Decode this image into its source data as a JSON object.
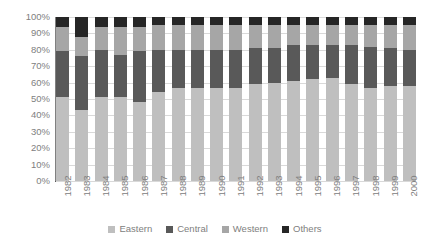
{
  "chart_data": {
    "type": "bar",
    "stacked": true,
    "stack_mode": "100-percent",
    "title": "",
    "xlabel": "",
    "ylabel": "",
    "ylim": [
      0,
      100
    ],
    "ytick_labels": [
      "100%",
      "90%",
      "80%",
      "70%",
      "60%",
      "50%",
      "40%",
      "30%",
      "20%",
      "10%",
      "0%"
    ],
    "ytick_values": [
      100,
      90,
      80,
      70,
      60,
      50,
      40,
      30,
      20,
      10,
      0
    ],
    "grid": true,
    "legend_position": "bottom",
    "categories": [
      "1982",
      "1983",
      "1984",
      "1985",
      "1986",
      "1987",
      "1988",
      "1989",
      "1990",
      "1991",
      "1992",
      "1993",
      "1994",
      "1995",
      "1996",
      "1997",
      "1998",
      "1999",
      "2000"
    ],
    "series": [
      {
        "name": "Eastern",
        "color": "#bfbfbf",
        "values": [
          51,
          43,
          51,
          51,
          48,
          54,
          57,
          57,
          57,
          57,
          59,
          60,
          61,
          62,
          63,
          59,
          57,
          58,
          58
        ]
      },
      {
        "name": "Central",
        "color": "#595959",
        "values": [
          28,
          33,
          29,
          26,
          31,
          26,
          23,
          23,
          23,
          23,
          22,
          21,
          22,
          21,
          20,
          24,
          25,
          23,
          22
        ]
      },
      {
        "name": "Western",
        "color": "#a6a6a6",
        "values": [
          15,
          12,
          14,
          17,
          15,
          15,
          15,
          15,
          15,
          15,
          14,
          14,
          12,
          12,
          12,
          12,
          13,
          14,
          15
        ]
      },
      {
        "name": "Others",
        "color": "#262626",
        "values": [
          6,
          12,
          6,
          6,
          6,
          5,
          5,
          5,
          5,
          5,
          5,
          5,
          5,
          5,
          5,
          5,
          5,
          5,
          5
        ]
      }
    ]
  },
  "legend": {
    "items": [
      {
        "label": "Eastern",
        "color": "#bfbfbf"
      },
      {
        "label": "Central",
        "color": "#595959"
      },
      {
        "label": "Western",
        "color": "#a6a6a6"
      },
      {
        "label": "Others",
        "color": "#262626"
      }
    ]
  },
  "colors": {
    "eastern": "#bfbfbf",
    "central": "#595959",
    "western": "#a6a6a6",
    "others": "#262626",
    "gridline": "#d9d9d9",
    "axis": "#808080",
    "text": "#808080",
    "background": "#ffffff"
  }
}
